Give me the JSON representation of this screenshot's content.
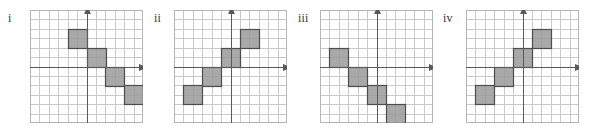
{
  "figure": {
    "title": "",
    "background_color": "#ffffff",
    "panel_count": 4
  },
  "style": {
    "grid_line_color": "#c9c9c9",
    "axis_line_color": "#595959",
    "border_color": "#b5b5b5",
    "shade_fill_color": "#9a9a9a",
    "shade_stroke_color": "#4d4d4d",
    "label_color": "#3a3a3a"
  },
  "chart_data": [
    {
      "type": "scatter",
      "panel_id": "i",
      "label": "i",
      "title": "",
      "xlabel": "",
      "ylabel": "",
      "grid": true,
      "legend": "none",
      "xlim": [
        -6,
        6
      ],
      "ylim": [
        -6,
        6
      ],
      "cell_size": 1,
      "axis_arrows": [
        "x-positive",
        "y-positive"
      ],
      "description": "Descending staircase of four shaded 2x2 blocks",
      "blocks": [
        {
          "x": -2,
          "y": 2,
          "w": 2,
          "h": 2
        },
        {
          "x": 0,
          "y": 0,
          "w": 2,
          "h": 2
        },
        {
          "x": 2,
          "y": -2,
          "w": 2,
          "h": 2
        },
        {
          "x": 4,
          "y": -4,
          "w": 2,
          "h": 2
        }
      ]
    },
    {
      "type": "scatter",
      "panel_id": "ii",
      "label": "ii",
      "title": "",
      "xlabel": "",
      "ylabel": "",
      "grid": true,
      "legend": "none",
      "xlim": [
        -6,
        6
      ],
      "ylim": [
        -6,
        6
      ],
      "cell_size": 1,
      "axis_arrows": [
        "x-positive",
        "y-positive"
      ],
      "description": "Ascending staircase of four shaded 2x2 blocks",
      "blocks": [
        {
          "x": -5,
          "y": -4,
          "w": 2,
          "h": 2
        },
        {
          "x": -3,
          "y": -2,
          "w": 2,
          "h": 2
        },
        {
          "x": -1,
          "y": 0,
          "w": 2,
          "h": 2
        },
        {
          "x": 1,
          "y": 2,
          "w": 2,
          "h": 2
        }
      ]
    },
    {
      "type": "scatter",
      "panel_id": "iii",
      "label": "iii",
      "title": "",
      "xlabel": "",
      "ylabel": "",
      "grid": true,
      "legend": "none",
      "xlim": [
        -6,
        6
      ],
      "ylim": [
        -6,
        6
      ],
      "cell_size": 1,
      "axis_arrows": [
        "x-positive",
        "y-positive"
      ],
      "description": "Descending staircase of four shaded 2x2 blocks starting left of the y-axis",
      "blocks": [
        {
          "x": -5,
          "y": 0,
          "w": 2,
          "h": 2
        },
        {
          "x": -3,
          "y": -2,
          "w": 2,
          "h": 2
        },
        {
          "x": -1,
          "y": -4,
          "w": 2,
          "h": 2
        },
        {
          "x": 1,
          "y": -6,
          "w": 2,
          "h": 2
        }
      ]
    },
    {
      "type": "scatter",
      "panel_id": "iv",
      "label": "iv",
      "title": "",
      "xlabel": "",
      "ylabel": "",
      "grid": true,
      "legend": "none",
      "xlim": [
        -6,
        6
      ],
      "ylim": [
        -6,
        6
      ],
      "cell_size": 1,
      "axis_arrows": [
        "x-positive",
        "y-positive"
      ],
      "description": "Ascending staircase of four shaded 2x2 blocks",
      "blocks": [
        {
          "x": -5,
          "y": -4,
          "w": 2,
          "h": 2
        },
        {
          "x": -3,
          "y": -2,
          "w": 2,
          "h": 2
        },
        {
          "x": -1,
          "y": 0,
          "w": 2,
          "h": 2
        },
        {
          "x": 1,
          "y": 2,
          "w": 2,
          "h": 2
        }
      ]
    }
  ],
  "layout": {
    "panels": [
      {
        "id": "i",
        "label_x": 8,
        "label_y": 12,
        "plot_x": 30,
        "plot_y": 10,
        "plot_w": 113,
        "plot_h": 113
      },
      {
        "id": "ii",
        "label_x": 154,
        "label_y": 12,
        "plot_x": 174,
        "plot_y": 10,
        "plot_w": 113,
        "plot_h": 113
      },
      {
        "id": "iii",
        "label_x": 298,
        "label_y": 12,
        "plot_x": 320,
        "plot_y": 10,
        "plot_w": 113,
        "plot_h": 113
      },
      {
        "id": "iv",
        "label_x": 443,
        "label_y": 12,
        "plot_x": 466,
        "plot_y": 10,
        "plot_w": 113,
        "plot_h": 113
      }
    ]
  }
}
